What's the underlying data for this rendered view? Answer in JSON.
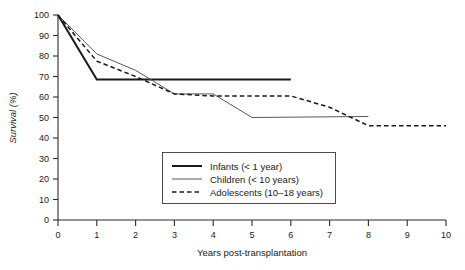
{
  "chart_data": {
    "type": "line",
    "title": "",
    "xlabel": "Years post-transplantation",
    "ylabel": "Survival (%)",
    "xlim": [
      0,
      10
    ],
    "ylim": [
      0,
      100
    ],
    "xticks": [
      "0",
      "1",
      "2",
      "3",
      "4",
      "5",
      "6",
      "7",
      "8",
      "9",
      "10"
    ],
    "yticks": [
      "0",
      "10",
      "20",
      "30",
      "40",
      "50",
      "60",
      "70",
      "80",
      "90",
      "100"
    ],
    "grid": false,
    "legend_position": "center-bottom-inside",
    "series": [
      {
        "name": "Infants (< 1 year)",
        "style": "solid-thick",
        "color": "#1a1a1a",
        "x": [
          0,
          1,
          2,
          6
        ],
        "values": [
          100,
          68.5,
          68.5,
          68.5
        ]
      },
      {
        "name": "Children (< 10 years)",
        "style": "solid-thin",
        "color": "#5a5a5a",
        "x": [
          0,
          1,
          2,
          3,
          4,
          5,
          8
        ],
        "values": [
          100,
          81,
          73,
          61.5,
          61.5,
          50,
          50.5
        ]
      },
      {
        "name": "Adolescents (10–18 years)",
        "style": "dashed",
        "color": "#1a1a1a",
        "x": [
          0,
          1,
          2,
          3,
          4,
          6,
          7,
          8,
          10
        ],
        "values": [
          100,
          77.5,
          70,
          61.5,
          60.5,
          60.5,
          55,
          46,
          46
        ]
      }
    ]
  },
  "legend": {
    "entries": [
      {
        "label": "Infants (< 1 year)",
        "swatch": "solid-thick-line-swatch"
      },
      {
        "label": "Children (< 10 years)",
        "swatch": "solid-thin-line-swatch"
      },
      {
        "label": "Adolescents (10–18 years)",
        "swatch": "dashed-line-swatch"
      }
    ]
  }
}
